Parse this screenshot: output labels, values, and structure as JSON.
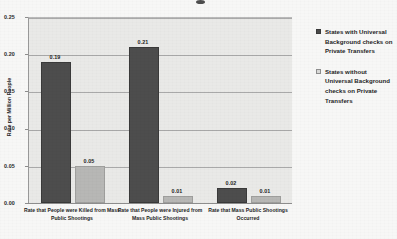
{
  "chart_data": {
    "type": "bar",
    "title": "",
    "xlabel": "",
    "ylabel": "Rate per Million People",
    "ylim": [
      0,
      0.25
    ],
    "yticks": [
      "0.00",
      "0.05",
      "0.10",
      "0.15",
      "0.20",
      "0.25"
    ],
    "ytick_values": [
      0.0,
      0.05,
      0.1,
      0.15,
      0.2,
      0.25
    ],
    "grid": true,
    "legend_position": "right",
    "categories": [
      "Rate that People were Killed from Mass Public Shootings",
      "Rate that People were Injured from Mass Public Shootings",
      "Rate that  Mass Public Shootings Occurred"
    ],
    "series": [
      {
        "name": "States with Universal Background checks on Private Transfers",
        "color": "#4d4d4d",
        "values": [
          0.19,
          0.21,
          0.02
        ],
        "value_labels": [
          "0.19",
          "0.21",
          "0.02"
        ]
      },
      {
        "name": "States without Universal Background checks on Private Transfers",
        "color": "#b7b7b5",
        "values": [
          0.05,
          0.01,
          0.01
        ],
        "value_labels": [
          "0.05",
          "0.01",
          "0.01"
        ]
      }
    ]
  },
  "legend": {
    "entries": [
      {
        "label": "States with Universal Background checks on Private Transfers"
      },
      {
        "label": "States without Universal Background checks on Private Transfers"
      }
    ]
  }
}
